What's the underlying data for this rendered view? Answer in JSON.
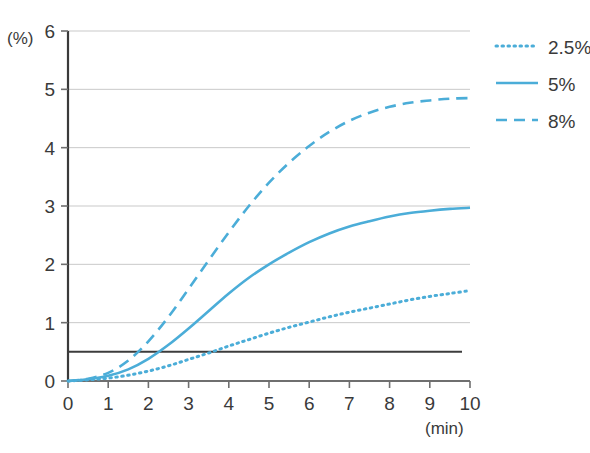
{
  "chart_data": {
    "type": "line",
    "title": "",
    "xlabel": "(min)",
    "ylabel": "(%)",
    "xlim": [
      0,
      10
    ],
    "ylim": [
      0,
      6
    ],
    "grid": true,
    "x_ticks": [
      "0",
      "1",
      "2",
      "3",
      "4",
      "5",
      "6",
      "7",
      "8",
      "9",
      "10"
    ],
    "y_ticks": [
      "0",
      "1",
      "2",
      "3",
      "4",
      "5",
      "6"
    ],
    "legend_position": "right",
    "line_color": "#4BADD8",
    "reference_line": {
      "value": 0.5,
      "color": "#3c3c3c",
      "orientation": "horizontal"
    },
    "x": [
      0,
      0.5,
      1,
      1.5,
      2,
      2.5,
      3,
      3.5,
      4,
      4.5,
      5,
      5.5,
      6,
      6.5,
      7,
      7.5,
      8,
      8.5,
      9,
      9.5,
      10
    ],
    "series": [
      {
        "name": "2.5%",
        "style": "dotted",
        "color": "#4BADD8",
        "values": [
          0,
          0.02,
          0.05,
          0.1,
          0.17,
          0.26,
          0.37,
          0.48,
          0.6,
          0.71,
          0.82,
          0.92,
          1.01,
          1.1,
          1.18,
          1.25,
          1.32,
          1.39,
          1.45,
          1.5,
          1.55
        ]
      },
      {
        "name": "5%",
        "style": "solid",
        "color": "#4BADD8",
        "values": [
          0,
          0.03,
          0.09,
          0.2,
          0.38,
          0.62,
          0.9,
          1.2,
          1.5,
          1.77,
          2.0,
          2.2,
          2.38,
          2.53,
          2.65,
          2.74,
          2.82,
          2.88,
          2.92,
          2.95,
          2.97
        ]
      },
      {
        "name": "8%",
        "style": "dashed",
        "color": "#4BADD8",
        "values": [
          0,
          0.04,
          0.14,
          0.35,
          0.68,
          1.1,
          1.58,
          2.07,
          2.55,
          3.0,
          3.4,
          3.74,
          4.03,
          4.27,
          4.46,
          4.6,
          4.7,
          4.77,
          4.81,
          4.84,
          4.85
        ]
      }
    ]
  },
  "legend": {
    "entries": [
      {
        "label": "2.5%",
        "style": "dotted"
      },
      {
        "label": "5%",
        "style": "solid"
      },
      {
        "label": "8%",
        "style": "dashed"
      }
    ]
  }
}
